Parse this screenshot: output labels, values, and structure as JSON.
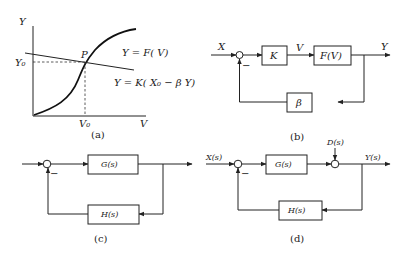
{
  "panel_a": {
    "y_axis": "Y",
    "x_axis": "V",
    "y0": "Y₀",
    "v0": "V₀",
    "point": "P",
    "curve1": "Y = F( V)",
    "curve2": "Y = K( X₀ − β Y)",
    "caption": "(a)"
  },
  "panel_b": {
    "input": "X",
    "mid_signal": "V",
    "output": "Y",
    "block1": "K",
    "block2": "F(V)",
    "feedback": "β",
    "minus": "−",
    "caption": "(b)"
  },
  "panel_c": {
    "forward": "G(s)",
    "feedback": "H(s)",
    "minus": "−",
    "caption": "(c)"
  },
  "panel_d": {
    "input": "X(s)",
    "output": "Y(s)",
    "disturbance": "D(s)",
    "forward": "G(s)",
    "feedback": "H(s)",
    "minus": "−",
    "caption": "(d)"
  }
}
